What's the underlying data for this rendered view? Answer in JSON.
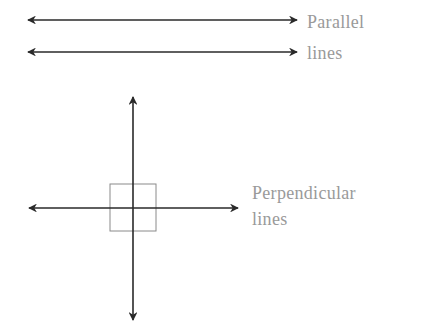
{
  "diagram": {
    "parallel": {
      "label_line1": "Parallel",
      "label_line2": "lines",
      "line_color": "#2a2a2a"
    },
    "perpendicular": {
      "label_line1": "Perpendicular",
      "label_line2": "lines",
      "line_color": "#2a2a2a",
      "right_angle_marker_color": "#8a8a8a"
    },
    "label_color": "#9a9a9a"
  }
}
